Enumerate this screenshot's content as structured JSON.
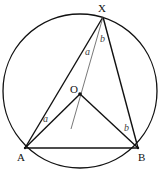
{
  "diagram": {
    "circle": {
      "cx": 80,
      "cy": 91,
      "r": 77
    },
    "points": {
      "X": {
        "label": "X",
        "x": 103,
        "y": 17
      },
      "A": {
        "label": "A",
        "x": 25,
        "y": 148
      },
      "B": {
        "label": "B",
        "x": 138,
        "y": 148
      },
      "O": {
        "label": "O",
        "x": 80,
        "y": 94
      }
    },
    "angle_labels": [
      {
        "text": "a",
        "x": 85,
        "y": 55
      },
      {
        "text": "b",
        "x": 100,
        "y": 41
      },
      {
        "text": "a",
        "x": 43,
        "y": 122
      },
      {
        "text": "b",
        "x": 126,
        "y": 131
      }
    ],
    "colors": {
      "stroke": "#111111",
      "thin": "#555555"
    }
  }
}
